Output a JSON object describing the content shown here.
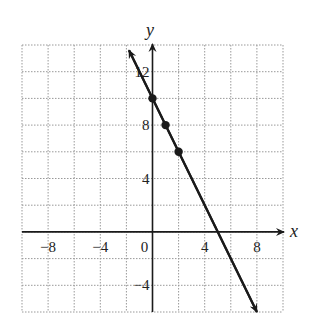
{
  "chart_data": {
    "type": "line",
    "title": "",
    "xlabel": "x",
    "ylabel": "y",
    "xlim": [
      -10,
      10
    ],
    "ylim": [
      -6,
      14
    ],
    "grid": true,
    "grid_step": 2,
    "x_ticks": [
      -8,
      -4,
      0,
      4,
      8
    ],
    "y_ticks": [
      -4,
      4,
      8,
      12
    ],
    "x_tick_labels": [
      "−8",
      "−4",
      "0",
      "4",
      "8"
    ],
    "y_tick_labels": [
      "−4",
      "4",
      "8",
      "12"
    ],
    "series": [
      {
        "name": "y = -2x + 10",
        "line": {
          "x_start": -1.8,
          "y_start": 13.6,
          "x_end": 8,
          "y_end": -6,
          "arrows": "both"
        },
        "points": [
          {
            "x": 0,
            "y": 10
          },
          {
            "x": 1,
            "y": 8
          },
          {
            "x": 2,
            "y": 6
          }
        ]
      }
    ],
    "colors": {
      "line": "#1a1a1a",
      "grid": "#999999",
      "axis": "#1a1a1a"
    }
  }
}
